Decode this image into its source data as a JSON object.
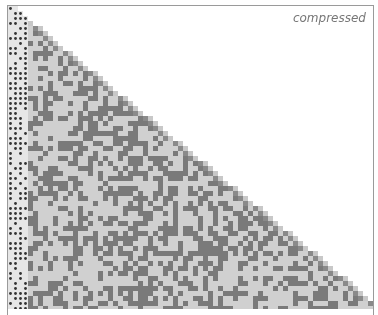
{
  "figure": {
    "label": "compressed",
    "cell_size": 5,
    "rows": 61,
    "slope": 1.22,
    "colors": {
      "background": "#ffffff",
      "light_cell": "#d0d0d0",
      "dark_cell": "#7a7a7a",
      "dot": "#333333",
      "edge_cell": "#8a8a8a",
      "frame": "#9a9a9a"
    },
    "dot_columns": 4,
    "seed": 1729
  }
}
